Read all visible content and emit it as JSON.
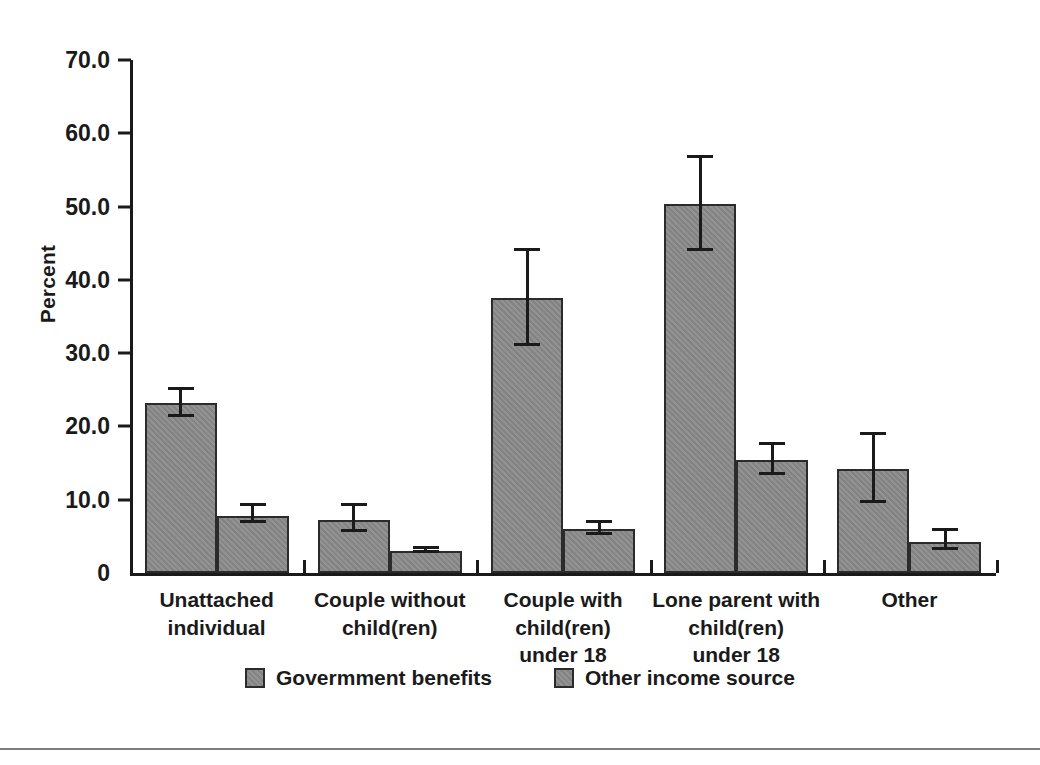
{
  "chart_data": {
    "type": "bar",
    "title": "",
    "xlabel": "",
    "ylabel": "Percent",
    "ylim": [
      0,
      70
    ],
    "ytick_labels": [
      "70.0",
      "60.0",
      "50.0",
      "40.0",
      "30.0",
      "20.0",
      "10.0",
      "0"
    ],
    "ytick_values": [
      70,
      60,
      50,
      40,
      30,
      20,
      10,
      0
    ],
    "grid": false,
    "legend_position": "bottom-center",
    "error_bars": true,
    "categories": [
      "Unattached\nindividual",
      "Couple without\nchild(ren)",
      "Couple with\nchild(ren)\nunder 18",
      "Lone parent with\nchild(ren)\nunder 18",
      "Other"
    ],
    "series": [
      {
        "name": "Govermment benefits",
        "color": "#8a8a8a",
        "values": [
          23.2,
          7.3,
          37.5,
          50.3,
          14.2
        ],
        "err_low": [
          21.3,
          5.6,
          31.0,
          44.0,
          9.6
        ],
        "err_high": [
          25.0,
          9.2,
          44.0,
          56.6,
          18.9
        ]
      },
      {
        "name": "Other income source",
        "color": "#8a8a8a",
        "values": [
          7.8,
          3.0,
          6.0,
          15.4,
          4.3
        ],
        "err_low": [
          6.8,
          2.7,
          5.2,
          13.4,
          3.1
        ],
        "err_high": [
          9.2,
          3.3,
          6.8,
          17.5,
          5.8
        ]
      }
    ]
  },
  "colors": {
    "bar_fill": "#8a8a8a",
    "bar_edge": "#2b2b2b",
    "axis": "#1a1a1a",
    "background": "#ffffff",
    "bottom_rule": "#7d7d7d"
  }
}
